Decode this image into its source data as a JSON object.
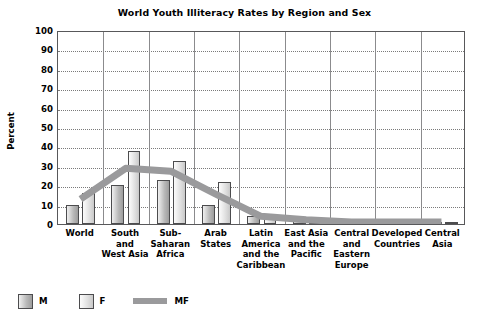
{
  "chart_data": {
    "type": "bar",
    "title": "World Youth Illiteracy Rates by Region and Sex",
    "xlabel": "",
    "ylabel": "Percent",
    "ylim": [
      0,
      100
    ],
    "ytick_step": 10,
    "yticks": [
      "100",
      "90",
      "80",
      "70",
      "60",
      "50",
      "40",
      "30",
      "20",
      "10",
      "0"
    ],
    "grid": true,
    "legend_position": "bottom-left",
    "categories": [
      "World",
      "South and West Asia",
      "Sub-Saharan Africa",
      "Arab States",
      "Latin America and the Caribbean",
      "East Asia and the Pacific",
      "Central and Eastern Europe",
      "Developed Countries",
      "Central Asia"
    ],
    "category_lines": [
      [
        "World"
      ],
      [
        "South",
        "and",
        "West Asia"
      ],
      [
        "Sub-",
        "Saharan",
        "Africa"
      ],
      [
        "Arab",
        "States"
      ],
      [
        "Latin",
        "America",
        "and the",
        "Caribbean"
      ],
      [
        "East Asia",
        "and the",
        "Pacific"
      ],
      [
        "Central",
        "and",
        "Eastern",
        "Europe"
      ],
      [
        "Developed",
        "Countries"
      ],
      [
        "Central",
        "Asia"
      ]
    ],
    "series": [
      {
        "name": "M",
        "type": "bar",
        "values": [
          10,
          20,
          22.5,
          10,
          4,
          2,
          1,
          1,
          1
        ]
      },
      {
        "name": "F",
        "type": "bar",
        "values": [
          16,
          37.5,
          32.5,
          21.5,
          4,
          2.5,
          1,
          1,
          1
        ]
      },
      {
        "name": "MF",
        "type": "line",
        "values": [
          13,
          29,
          27.5,
          15.5,
          4,
          2.2,
          1,
          1,
          1
        ]
      }
    ]
  },
  "legend": {
    "items": [
      {
        "label": "M",
        "swatch": "bar-dark-gray",
        "color": "#b9b9b9"
      },
      {
        "label": "F",
        "swatch": "bar-light-gray",
        "color": "#dedede"
      },
      {
        "label": "MF",
        "swatch": "line-gray",
        "color": "#9a9a9c"
      }
    ]
  },
  "colors": {
    "frame": "#58585a",
    "gridline": "#7a7a7a",
    "category_separator": "#8b8b8d",
    "bar_border": "#4c4c4e",
    "mf_line": "#9a9a9c",
    "text": "#000000",
    "background": "#ffffff"
  }
}
